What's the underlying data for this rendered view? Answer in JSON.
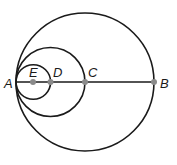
{
  "diagram": {
    "points": [
      {
        "id": "A",
        "label": "A"
      },
      {
        "id": "E",
        "label": "E"
      },
      {
        "id": "D",
        "label": "D"
      },
      {
        "id": "C",
        "label": "C"
      },
      {
        "id": "B",
        "label": "B"
      }
    ],
    "circles": [
      {
        "id": "large",
        "diameter": "AB",
        "center": "C"
      },
      {
        "id": "medium",
        "diameter": "AC",
        "center": "D"
      },
      {
        "id": "small",
        "diameter": "AD",
        "center": "E"
      }
    ],
    "segments": [
      {
        "from": "A",
        "to": "B"
      }
    ],
    "colors": {
      "stroke": "#1a1a1a",
      "point": "#8a8a8a"
    }
  }
}
